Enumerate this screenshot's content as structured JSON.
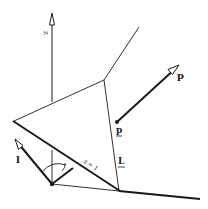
{
  "diagram": {
    "labels": {
      "z_axis": "z",
      "p_vector": "p",
      "p_point": "p",
      "L_line": "L",
      "l_vector": "l",
      "z_plane": "z = 1"
    },
    "colors": {
      "stroke": "#1a1a1a",
      "background": "#ffffff"
    }
  }
}
